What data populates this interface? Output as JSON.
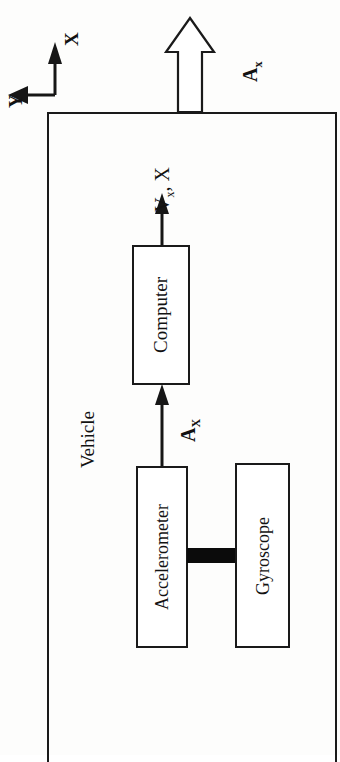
{
  "diagram": {
    "title_label": "Vehicle",
    "axes": {
      "x_label": "X",
      "y_label": "Y"
    },
    "external_arrow": {
      "label": "A",
      "subscript": "x"
    },
    "output_signal": {
      "label": "V",
      "subscript": "x",
      "suffix": ", X"
    },
    "internal_signal": {
      "label": "A",
      "subscript": "X"
    },
    "boxes": [
      {
        "name": "computer",
        "label": "Computer"
      },
      {
        "name": "accelerometer",
        "label": "Accelerometer"
      },
      {
        "name": "gyroscope",
        "label": "Gyroscope"
      }
    ],
    "colors": {
      "ink": "#1a1a1a",
      "paper": "#fdfdfc",
      "connector": "#0b0b0b"
    }
  }
}
